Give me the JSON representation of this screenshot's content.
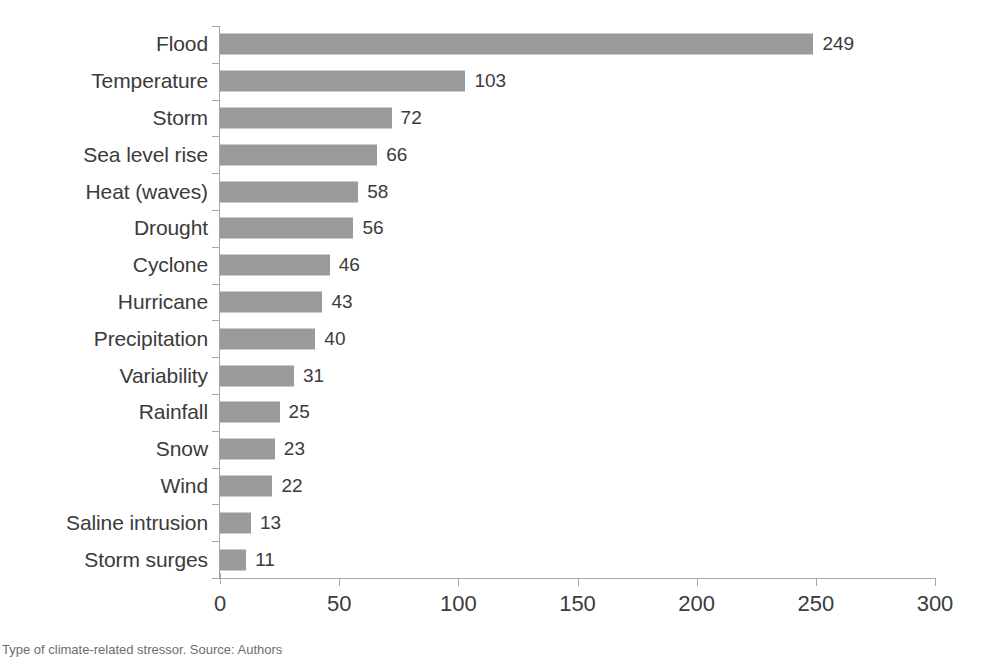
{
  "chart_data": {
    "type": "bar",
    "orientation": "horizontal",
    "title": "",
    "subtitle": "",
    "xlabel": "",
    "ylabel": "",
    "xlim": [
      0,
      300
    ],
    "xticks": [
      0,
      50,
      100,
      150,
      200,
      250,
      300
    ],
    "grid": false,
    "legend": null,
    "bar_color": "#9a9a9a",
    "axis_color": "#a6a6a6",
    "text_color": "#3b3b3b",
    "categories": [
      "Flood",
      "Temperature",
      "Storm",
      "Sea level rise",
      "Heat (waves)",
      "Drought",
      "Cyclone",
      "Hurricane",
      "Precipitation",
      "Variability",
      "Rainfall",
      "Snow",
      "Wind",
      "Saline intrusion",
      "Storm surges"
    ],
    "values": [
      249,
      103,
      72,
      66,
      58,
      56,
      46,
      43,
      40,
      31,
      25,
      23,
      22,
      13,
      11
    ],
    "data_labels": [
      "249",
      "103",
      "72",
      "66",
      "58",
      "56",
      "46",
      "43",
      "40",
      "31",
      "25",
      "23",
      "22",
      "13",
      "11"
    ]
  },
  "caption": {
    "text": "Type of climate-related stressor. Source: Authors"
  }
}
